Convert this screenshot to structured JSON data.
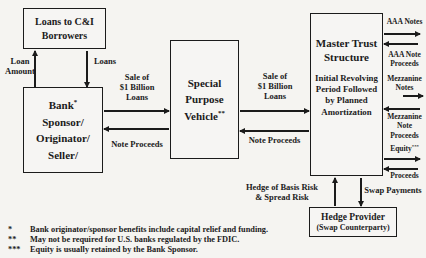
{
  "diagram": {
    "boxes": {
      "borrowers": {
        "title": "Loans to C&I\nBorrowers"
      },
      "bank": {
        "title": "Bank",
        "sup": "*",
        "rest": "Sponsor/\nOriginator/\nSeller/"
      },
      "spv": {
        "title_top": "Special\nPurpose",
        "title_bottom": "Vehicle",
        "sup": "**"
      },
      "master_trust": {
        "title": "Master Trust\nStructure",
        "subtitle": "Initial Revolving\nPeriod Followed\nby Planned\nAmortization"
      },
      "hedge_provider": {
        "title": "Hedge Provider",
        "subtitle": "(Swap Counterparty)"
      }
    },
    "labels": {
      "loan_amount": "Loan\nAmount",
      "loans": "Loans",
      "sale_left": "Sale of\n$1 Billion\nLoans",
      "note_proceeds_left": "Note Proceeds",
      "sale_right": "Sale of\n$1 Billion\nLoans",
      "note_proceeds_right": "Note Proceeds",
      "aaa_notes": "AAA Notes",
      "aaa_note_proceeds": "AAA Note\nProceeds",
      "mezzanine_notes": "Mezzanine\nNotes",
      "mezzanine_note_proceeds": "Mezzanine\nNote\nProceeds",
      "equity": "Equity",
      "equity_sup": "***",
      "proceeds": "Proceeds",
      "hedge_risk": "Hedge of Basis Risk\n& Spread Risk",
      "swap_payments": "Swap Payments"
    },
    "footnotes": [
      {
        "marker": "*",
        "text": "Bank originator/sponsor benefits include capital relief and funding."
      },
      {
        "marker": "**",
        "text": "May not be required for U.S. banks regulated by the FDIC."
      },
      {
        "marker": "***",
        "text": "Equity is usually retained by the Bank Sponsor."
      }
    ],
    "colors": {
      "background": "#f5f4f1",
      "ink": "#1b1b1b"
    }
  }
}
